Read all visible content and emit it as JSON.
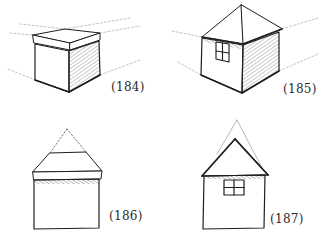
{
  "figures": [
    {
      "id": "184",
      "label": "(184)",
      "subject": "box-with-lid-two-point-perspective"
    },
    {
      "id": "185",
      "label": "(185)",
      "subject": "house-hip-roof-two-point-perspective"
    },
    {
      "id": "186",
      "label": "(186)",
      "subject": "house-front-view-dotted-roof-apex"
    },
    {
      "id": "187",
      "label": "(187)",
      "subject": "house-front-view-gable-roof-with-window"
    }
  ],
  "colors": {
    "ink": "#1e1e1e",
    "guide": "#9a9a9a",
    "shade": "#b8b8b8",
    "background": "#ffffff"
  }
}
